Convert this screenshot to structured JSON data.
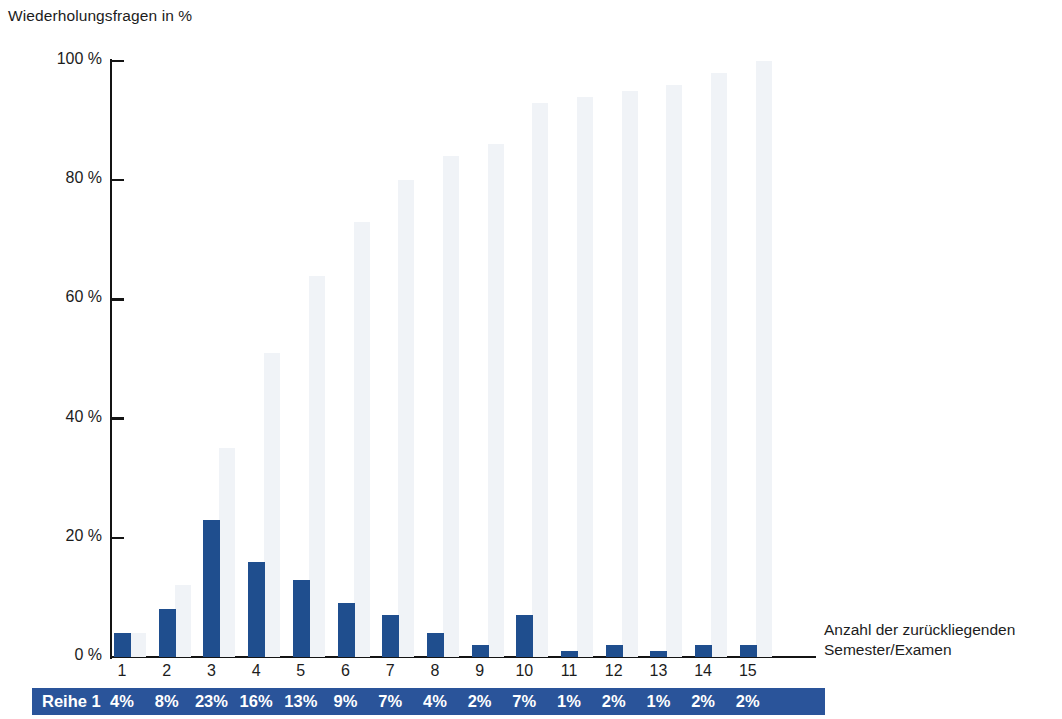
{
  "chart_data": {
    "type": "bar",
    "title": "Wiederholungsfragen in %",
    "xlabel": "Anzahl der zurückliegenden Semester/Examen",
    "ylabel": "Wiederholungsfragen in %",
    "ylim": [
      0,
      100
    ],
    "grid": false,
    "legend": "none",
    "categories": [
      "1",
      "2",
      "3",
      "4",
      "5",
      "6",
      "7",
      "8",
      "9",
      "10",
      "11",
      "12",
      "13",
      "14",
      "15"
    ],
    "y_ticks": [
      "0 %",
      "20 %",
      "40 %",
      "60 %",
      "80 %",
      "100 %"
    ],
    "y_tick_values": [
      0,
      20,
      40,
      60,
      80,
      100
    ],
    "series": [
      {
        "name": "Reihe 1",
        "color": "#1f4e8e",
        "values": [
          4,
          8,
          23,
          16,
          13,
          9,
          7,
          4,
          2,
          7,
          1,
          2,
          1,
          2,
          2
        ],
        "labels": [
          "4%",
          "8%",
          "23%",
          "16%",
          "13%",
          "9%",
          "7%",
          "4%",
          "2%",
          "7%",
          "1%",
          "2%",
          "1%",
          "2%",
          "2%"
        ]
      },
      {
        "name": "Kumuliert",
        "color": "#f0f3f7",
        "values": [
          4,
          12,
          35,
          51,
          64,
          73,
          80,
          84,
          86,
          93,
          94,
          95,
          96,
          98,
          100
        ]
      }
    ]
  },
  "table": {
    "row_label": "Reihe 1",
    "values": [
      "4%",
      "8%",
      "23%",
      "16%",
      "13%",
      "9%",
      "7%",
      "4%",
      "2%",
      "7%",
      "1%",
      "2%",
      "1%",
      "2%",
      "2%"
    ],
    "background": "#2a549a",
    "text_color": "#ffffff"
  },
  "axis_caption": {
    "line1": "Anzahl der zurückliegenden",
    "line2": "Semester/Examen"
  }
}
